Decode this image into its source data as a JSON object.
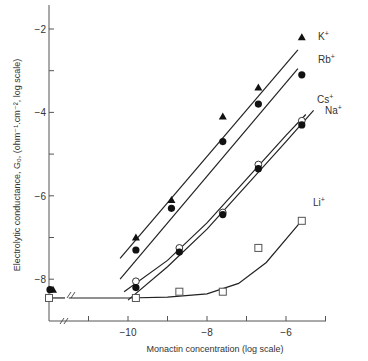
{
  "chart_data": {
    "type": "scatter",
    "title": "",
    "xlabel": "Monactin concentration (log scale)",
    "ylabel": "Electrolytic conductance, G₀, (ohm⁻¹.cm⁻², log scale)",
    "xlim": [
      -12.1,
      -4.7
    ],
    "ylim": [
      -8.9,
      -1.5
    ],
    "x_ticks": [
      -11,
      -10,
      -9,
      -8,
      -7,
      -6,
      -5
    ],
    "x_tick_labels": [
      "",
      "-10",
      "",
      "-8",
      "",
      "-6",
      ""
    ],
    "y_ticks": [
      -2,
      -3,
      -4,
      -5,
      -6,
      -7,
      -8
    ],
    "y_tick_labels": [
      "-2",
      "",
      "-4",
      "",
      "-6",
      "",
      "-8"
    ],
    "axis_breaks": {
      "x": true,
      "y": true
    },
    "grid": false,
    "legend": "inline labels at right end of each series",
    "baseline_x": -12.1,
    "series": [
      {
        "name": "K+",
        "label": "K",
        "sup": "+",
        "marker": "filled-triangle",
        "x": [
          -12.1,
          -9.8,
          -8.9,
          -7.6,
          -6.7,
          -5.6
        ],
        "y": [
          -8.25,
          -7.0,
          -6.1,
          -4.1,
          -3.4,
          -2.2
        ],
        "fit_line": {
          "x": [
            -10.2,
            -5.7
          ],
          "y": [
            -7.5,
            -2.5
          ]
        }
      },
      {
        "name": "Rb+",
        "label": "Rb",
        "sup": "+",
        "marker": "filled-circle",
        "x": [
          -12.1,
          -9.8,
          -8.9,
          -7.6,
          -6.7,
          -5.6
        ],
        "y": [
          -8.25,
          -7.3,
          -6.3,
          -4.7,
          -3.8,
          -3.1
        ],
        "fit_line": {
          "x": [
            -10.2,
            -5.7
          ],
          "y": [
            -8.0,
            -2.95
          ]
        }
      },
      {
        "name": "Cs+",
        "label": "Cs",
        "sup": "+",
        "marker": "open-circle",
        "x": [
          -9.8,
          -8.7,
          -7.6,
          -6.7,
          -5.6
        ],
        "y": [
          -8.05,
          -7.25,
          -6.4,
          -5.25,
          -4.2
        ],
        "fit_line": {
          "x": [
            -10.1,
            -9.0,
            -8.0,
            -7.0,
            -6.0,
            -5.5
          ],
          "y": [
            -8.3,
            -7.55,
            -6.65,
            -5.6,
            -4.55,
            -4.05
          ]
        }
      },
      {
        "name": "Na+",
        "label": "Na",
        "sup": "+",
        "marker": "filled-circle",
        "x": [
          -9.8,
          -8.7,
          -7.6,
          -6.7,
          -5.6
        ],
        "y": [
          -8.2,
          -7.35,
          -6.45,
          -5.35,
          -4.3
        ],
        "fit_line": {
          "x": [
            -10.0,
            -9.0,
            -8.0,
            -7.0,
            -6.0,
            -5.3
          ],
          "y": [
            -8.5,
            -7.7,
            -6.8,
            -5.75,
            -4.7,
            -3.95
          ]
        }
      },
      {
        "name": "Li+",
        "label": "Li",
        "sup": "+",
        "marker": "open-square",
        "x": [
          -12.1,
          -9.8,
          -8.7,
          -7.6,
          -6.7,
          -5.6
        ],
        "y": [
          -8.45,
          -8.45,
          -8.3,
          -8.3,
          -7.25,
          -6.6
        ],
        "fit_line": {
          "x": [
            -11.5,
            -10.0,
            -9.0,
            -8.0,
            -7.2,
            -6.5,
            -5.65
          ],
          "y": [
            -8.45,
            -8.45,
            -8.43,
            -8.35,
            -8.1,
            -7.6,
            -6.65
          ]
        }
      }
    ]
  }
}
